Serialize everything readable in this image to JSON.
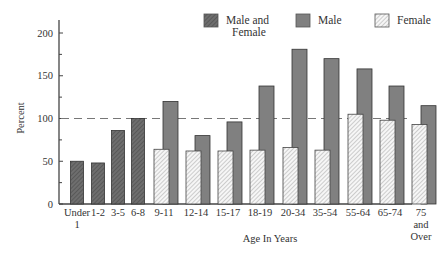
{
  "chart_data": {
    "type": "bar",
    "title": "",
    "xlabel": "Age In Years",
    "ylabel": "Percent",
    "ylim": [
      0,
      215
    ],
    "yticks": [
      0,
      50,
      100,
      150,
      200
    ],
    "reference_line": {
      "value": 100,
      "style": "dashed"
    },
    "grid": false,
    "legend_position": "top-right",
    "legend": [
      "Male and Female",
      "Male",
      "Female"
    ],
    "categories": [
      "Under 1",
      "1-2",
      "3-5",
      "6-8",
      "9-11",
      "12-14",
      "15-17",
      "18-19",
      "20-34",
      "35-54",
      "55-64",
      "65-74",
      "75 and Over"
    ],
    "series": [
      {
        "name": "Male and Female",
        "values": [
          50,
          48,
          86,
          100,
          null,
          null,
          null,
          null,
          null,
          null,
          null,
          null,
          null
        ]
      },
      {
        "name": "Male",
        "values": [
          null,
          null,
          null,
          null,
          120,
          80,
          96,
          138,
          181,
          170,
          158,
          138,
          115
        ]
      },
      {
        "name": "Female",
        "values": [
          null,
          null,
          null,
          null,
          64,
          62,
          62,
          63,
          66,
          63,
          105,
          98,
          93
        ]
      }
    ]
  },
  "axis": {
    "y_title": "Percent",
    "x_title": "Age In Years",
    "y_ticks": [
      "0",
      "50",
      "100",
      "150",
      "200"
    ],
    "x_labels": [
      [
        "Under",
        "1"
      ],
      [
        "1-2"
      ],
      [
        "3-5"
      ],
      [
        "6-8"
      ],
      [
        "9-11"
      ],
      [
        "12-14"
      ],
      [
        "15-17"
      ],
      [
        "18-19"
      ],
      [
        "20-34"
      ],
      [
        "35-54"
      ],
      [
        "55-64"
      ],
      [
        "65-74"
      ],
      [
        "75",
        "and",
        "Over"
      ]
    ]
  },
  "legend": {
    "items": [
      {
        "label_lines": [
          "Male and",
          "Female"
        ],
        "pattern": "dark-hatch"
      },
      {
        "label_lines": [
          "Male"
        ],
        "pattern": "solid-gray"
      },
      {
        "label_lines": [
          "Female"
        ],
        "pattern": "light-hatch"
      }
    ]
  },
  "colors": {
    "male_and_female": "#6a6a6a",
    "male": "#808080",
    "female": "#f4f4f4",
    "axis": "#444444",
    "reference_line": "#777777"
  }
}
